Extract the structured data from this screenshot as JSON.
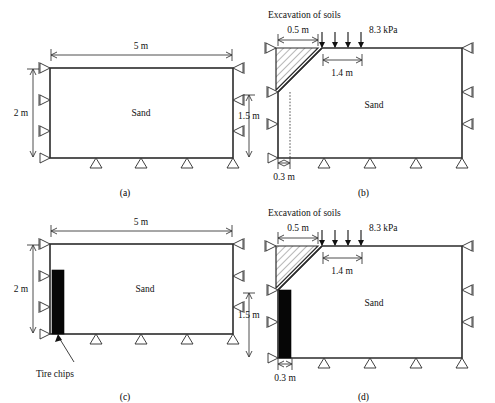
{
  "figure": {
    "soil_label": "Sand",
    "colors": {
      "line": "#2b2b2b",
      "chips": "#060606",
      "hatch": "#4a4a4a"
    }
  },
  "panels": [
    {
      "id": "a",
      "caption": "(a)",
      "width_label": "5 m",
      "height_label": "2 m",
      "soil_label": "Sand",
      "has_excavation": false,
      "has_tire_chips": false,
      "bottom_supports": 3,
      "side_supports": 3
    },
    {
      "id": "b",
      "caption": "(b)",
      "excavation_label": "Excavation of soils",
      "top_width_label": "0.5 m",
      "surcharge_label": "8.3 kPa",
      "offset_label": "1.4 m",
      "height_label": "1.5 m",
      "base_width_label": "0.3 m",
      "soil_label": "Sand",
      "has_excavation": true,
      "has_tire_chips": false,
      "load_arrows": 4,
      "bottom_supports": 3,
      "side_supports": 3
    },
    {
      "id": "c",
      "caption": "(c)",
      "width_label": "5 m",
      "height_label": "2 m",
      "soil_label": "Sand",
      "tire_chips_label": "Tire chips",
      "has_excavation": false,
      "has_tire_chips": true,
      "bottom_supports": 3,
      "side_supports": 3
    },
    {
      "id": "d",
      "caption": "(d)",
      "excavation_label": "Excavation of soils",
      "top_width_label": "0.5 m",
      "surcharge_label": "8.3 kPa",
      "offset_label": "1.4 m",
      "height_label": "1.5 m",
      "base_width_label": "0.3 m",
      "soil_label": "Sand",
      "has_excavation": true,
      "has_tire_chips": true,
      "load_arrows": 4,
      "bottom_supports": 3,
      "side_supports": 3
    }
  ]
}
